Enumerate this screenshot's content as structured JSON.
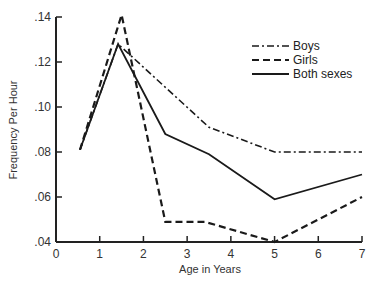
{
  "chart_data": {
    "type": "line",
    "title": "",
    "xlabel": "Age in Years",
    "ylabel": "Frequency Per Hour",
    "xlim": [
      0,
      7
    ],
    "ylim": [
      0.04,
      0.14
    ],
    "x_ticks": [
      "0",
      "1",
      "2",
      "3",
      "4",
      "5",
      "6",
      "7"
    ],
    "y_ticks": [
      ".04",
      ".06",
      ".08",
      ".10",
      ".12",
      ".14"
    ],
    "grid": false,
    "legend_position": "upper right",
    "series": [
      {
        "name": "Boys",
        "style": "dash-dot",
        "x": [
          0.55,
          1.42,
          3.5,
          5,
          7
        ],
        "values": [
          0.081,
          0.128,
          0.091,
          0.08,
          0.08
        ]
      },
      {
        "name": "Girls",
        "style": "dashed",
        "x": [
          0.55,
          1.5,
          2.5,
          3.4,
          5,
          7
        ],
        "values": [
          0.081,
          0.141,
          0.049,
          0.049,
          0.04,
          0.06
        ]
      },
      {
        "name": "Both sexes",
        "style": "solid",
        "x": [
          0.55,
          1.42,
          2.5,
          3.5,
          5,
          7
        ],
        "values": [
          0.081,
          0.128,
          0.088,
          0.079,
          0.059,
          0.07
        ]
      }
    ]
  },
  "legend": {
    "items": [
      {
        "label": "Boys"
      },
      {
        "label": "Girls"
      },
      {
        "label": "Both sexes"
      }
    ]
  },
  "axes": {
    "x_title": "Age in Years",
    "y_title": "Frequency Per Hour"
  }
}
